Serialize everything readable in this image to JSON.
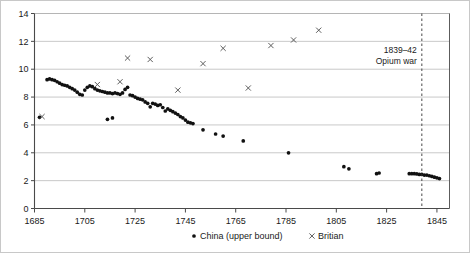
{
  "chart_data": {
    "type": "scatter",
    "title": "",
    "xlabel": "",
    "ylabel": "",
    "xlim": [
      1685,
      1850
    ],
    "ylim": [
      0,
      14
    ],
    "xticks": [
      1685,
      1705,
      1725,
      1745,
      1765,
      1785,
      1805,
      1825,
      1845
    ],
    "yticks": [
      0,
      2,
      4,
      6,
      8,
      10,
      12,
      14
    ],
    "grid": "horizontal",
    "legend_position": "bottom-center",
    "series": [
      {
        "name": "China (upper bound)",
        "marker": "dot",
        "color": "#111111",
        "points": [
          [
            1687,
            6.55
          ],
          [
            1690,
            9.25
          ],
          [
            1691,
            9.3
          ],
          [
            1692,
            9.25
          ],
          [
            1693,
            9.2
          ],
          [
            1694,
            9.1
          ],
          [
            1695,
            9.0
          ],
          [
            1696,
            8.9
          ],
          [
            1697,
            8.85
          ],
          [
            1698,
            8.8
          ],
          [
            1699,
            8.7
          ],
          [
            1700,
            8.6
          ],
          [
            1701,
            8.5
          ],
          [
            1702,
            8.35
          ],
          [
            1703,
            8.2
          ],
          [
            1704,
            8.15
          ],
          [
            1705,
            8.5
          ],
          [
            1706,
            8.7
          ],
          [
            1707,
            8.8
          ],
          [
            1708,
            8.75
          ],
          [
            1709,
            8.6
          ],
          [
            1710,
            8.5
          ],
          [
            1711,
            8.45
          ],
          [
            1712,
            8.4
          ],
          [
            1713,
            8.35
          ],
          [
            1714,
            8.3
          ],
          [
            1715,
            8.3
          ],
          [
            1716,
            8.25
          ],
          [
            1717,
            8.3
          ],
          [
            1718,
            8.25
          ],
          [
            1719,
            8.2
          ],
          [
            1720,
            8.3
          ],
          [
            1721,
            8.55
          ],
          [
            1722,
            8.7
          ],
          [
            1714,
            6.4
          ],
          [
            1716,
            6.5
          ],
          [
            1723,
            8.15
          ],
          [
            1724,
            8.1
          ],
          [
            1725,
            8.0
          ],
          [
            1726,
            7.9
          ],
          [
            1727,
            7.85
          ],
          [
            1728,
            7.8
          ],
          [
            1729,
            7.65
          ],
          [
            1730,
            7.55
          ],
          [
            1731,
            7.3
          ],
          [
            1732,
            7.55
          ],
          [
            1733,
            7.5
          ],
          [
            1734,
            7.4
          ],
          [
            1735,
            7.45
          ],
          [
            1736,
            7.25
          ],
          [
            1737,
            7.0
          ],
          [
            1738,
            7.15
          ],
          [
            1739,
            7.05
          ],
          [
            1740,
            6.95
          ],
          [
            1741,
            6.85
          ],
          [
            1742,
            6.75
          ],
          [
            1743,
            6.6
          ],
          [
            1744,
            6.5
          ],
          [
            1745,
            6.35
          ],
          [
            1746,
            6.2
          ],
          [
            1747,
            6.15
          ],
          [
            1748,
            6.1
          ],
          [
            1752,
            5.65
          ],
          [
            1757,
            5.35
          ],
          [
            1760,
            5.2
          ],
          [
            1768,
            4.85
          ],
          [
            1786,
            4.0
          ],
          [
            1808,
            3.0
          ],
          [
            1810,
            2.85
          ],
          [
            1821,
            2.5
          ],
          [
            1822,
            2.55
          ],
          [
            1834,
            2.5
          ],
          [
            1835,
            2.5
          ],
          [
            1836,
            2.5
          ],
          [
            1837,
            2.48
          ],
          [
            1838,
            2.45
          ],
          [
            1839,
            2.45
          ],
          [
            1840,
            2.4
          ],
          [
            1841,
            2.4
          ],
          [
            1842,
            2.35
          ],
          [
            1843,
            2.3
          ],
          [
            1844,
            2.25
          ],
          [
            1845,
            2.2
          ],
          [
            1846,
            2.15
          ]
        ]
      },
      {
        "name": "Britian",
        "marker": "cross",
        "color": "#555555",
        "points": [
          [
            1688,
            6.6
          ],
          [
            1710,
            8.9
          ],
          [
            1719,
            9.1
          ],
          [
            1722,
            10.8
          ],
          [
            1731,
            10.7
          ],
          [
            1742,
            8.5
          ],
          [
            1752,
            10.4
          ],
          [
            1760,
            11.5
          ],
          [
            1770,
            8.65
          ],
          [
            1779,
            11.7
          ],
          [
            1788,
            12.1
          ],
          [
            1798,
            12.8
          ]
        ]
      }
    ],
    "annotations": [
      {
        "name": "opium-war",
        "line1": "1839–42",
        "line2": "Opium war",
        "x": 1839,
        "style": "dashed-vertical-line"
      }
    ]
  },
  "legend": {
    "items": [
      {
        "label": "China (upper bound)",
        "marker": "dot"
      },
      {
        "label": "Britian",
        "marker": "cross"
      }
    ]
  },
  "colors": {
    "china": "#111111",
    "britain": "#555555",
    "grid": "#b0b0b0",
    "axis": "#4a4a4a",
    "text": "#1a1a1a",
    "frame": "#c8c8c8"
  }
}
